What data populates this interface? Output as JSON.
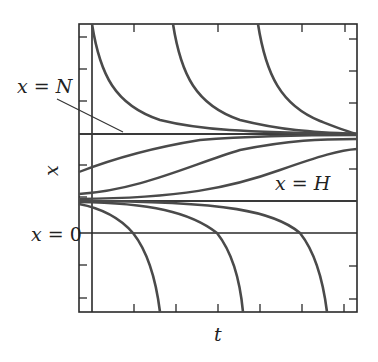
{
  "diagram": {
    "type": "phase-line solution curves",
    "labels": {
      "n_line": "x = N",
      "h_line": "x = H",
      "zero_line": "x = 0",
      "y_axis": "x",
      "x_axis": "t"
    },
    "colors": {
      "curve": "#4a4a4a",
      "frame": "#2a2a2a",
      "line": "#2a2a2a"
    },
    "equilibria": [
      {
        "name": "N",
        "stable": true
      },
      {
        "name": "H",
        "stable": false
      },
      {
        "name": "0",
        "stable": false
      }
    ],
    "curve_families": [
      {
        "name": "above N, decaying to N",
        "count": 3
      },
      {
        "name": "between H and N, rising to N",
        "count": 3
      },
      {
        "name": "below H, diverging downward past 0",
        "count": 3
      }
    ],
    "top_ticks": 4,
    "bottom_ticks": 6,
    "left_ticks": 8,
    "right_ticks": 8
  }
}
